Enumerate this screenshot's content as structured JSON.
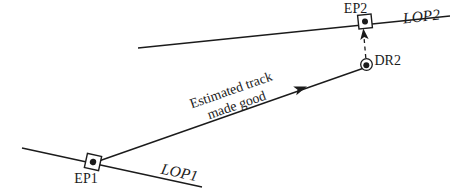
{
  "background": "#ffffff",
  "ink": "#1b1b1b",
  "diagram": {
    "points": {
      "ep1": {
        "label": "EP1",
        "symbol": "square-with-dot"
      },
      "ep2": {
        "label": "EP2",
        "symbol": "square-with-dot"
      },
      "dr2": {
        "label": "DR2",
        "symbol": "circle-with-dot"
      }
    },
    "lines": {
      "lop1": {
        "label": "LOP1",
        "style": "solid"
      },
      "lop2": {
        "label": "LOP2",
        "style": "solid"
      },
      "track": {
        "label_line1": "Estimated track",
        "label_line2": "made good",
        "style": "solid-with-arrowhead"
      },
      "dr_to_ep": {
        "style": "dashed-with-arrowhead"
      }
    }
  }
}
